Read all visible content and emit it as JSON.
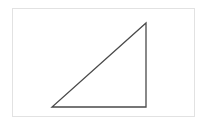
{
  "diagram": {
    "shape": "right-triangle",
    "stroke_color": "#4a4a4a",
    "fill_color": "none",
    "frame_color": "#e2e2e2",
    "vertices": [
      {
        "name": "bottom-left",
        "x": 0,
        "y": 0
      },
      {
        "name": "bottom-right",
        "x": 1,
        "y": 0
      },
      {
        "name": "top-right",
        "x": 1,
        "y": 0.9
      }
    ]
  }
}
